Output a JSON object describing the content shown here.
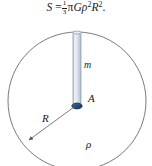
{
  "figure": {
    "formula": {
      "lhs": "S",
      "equals": "=",
      "fraction_numerator": "1",
      "fraction_denominator": "3",
      "pi": "π",
      "gravitational_constant": "G",
      "density_symbol": "ρ",
      "density_exponent": "2",
      "radius_symbol": "R",
      "radius_exponent": "2",
      "period": "."
    },
    "labels": {
      "mass": "m",
      "area": "A",
      "radius": "R",
      "density": "ρ"
    },
    "colors": {
      "outline": "#6b6b6b",
      "cylinder_fill": "#cfdbe6",
      "cylinder_edge": "#8a9aa8",
      "disk_fill": "#2e4c7a",
      "disk_edge": "#1b2f52",
      "text": "#1a1a1a",
      "background": "#ffffff"
    }
  }
}
